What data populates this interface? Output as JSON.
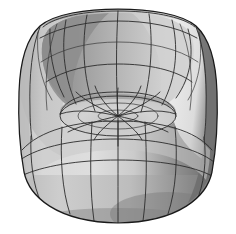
{
  "image": {
    "title": "3D rendered armchair",
    "subject_name": "tub-armchair",
    "background_color": "#ffffff",
    "width": 236,
    "height": 234,
    "render_style": "shaded-grayscale-with-wireframe",
    "projection": "perspective",
    "viewpoint": "front-slightly-above"
  },
  "palette": {
    "background": "#ffffff",
    "outline": "#1a1a1a",
    "wire": "#2b2b2b",
    "wire_light": "#3a3a3a",
    "back_inner_left_dark": "#8f8f8f",
    "back_inner_left_mid": "#9e9e9e",
    "back_inner_center": "#b8b8b8",
    "back_inner_right": "#cfcfcf",
    "back_rim_top": "#b0b0b0",
    "arm_right_highlight": "#e9e9e9",
    "arm_left_mid": "#c4c4c4",
    "seat_cushion": "#d4d4d4",
    "seat_cushion_shadow": "#b5b5b5",
    "base_left_light": "#dcdcdc",
    "base_center": "#c8c8c8",
    "base_right_shade": "#8a8a8a",
    "base_right_dark": "#6e6e6e",
    "base_bottom_shadow": "#7d7d7d",
    "outer_rim_right_dark": "#707070",
    "outer_rim_left": "#c0c0c0"
  },
  "geometry": {
    "chair_type": "tub chair / beanbag armchair",
    "mesh": {
      "type": "quad-patch-nurbs",
      "backrest_vertical_ribs": 9,
      "backrest_horizontal_rings": 3,
      "base_horizontal_bands": 3,
      "base_vertical_ribs": 8,
      "seat_radial_spokes": 12,
      "seat_concentric_rings": 3,
      "seat_convergence_point": [
        118,
        116
      ]
    },
    "bounds": {
      "top_y": 11,
      "bottom_y": 223,
      "left_x": 17,
      "right_x": 216,
      "back_top_left_x": 42,
      "back_top_right_x": 200
    }
  },
  "labels": {
    "caption": ""
  }
}
